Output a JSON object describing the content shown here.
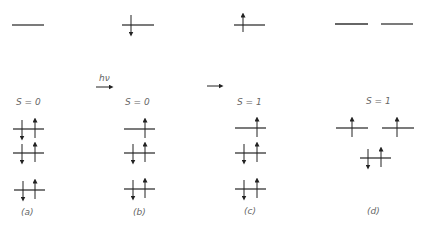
{
  "panels": [
    {
      "id": "a",
      "label": "(a)",
      "spin_label": "S = 0"
    },
    {
      "id": "b",
      "label": "(b)",
      "spin_label": "S = 0"
    },
    {
      "id": "c",
      "label": "(c)",
      "spin_label": "S = 1"
    },
    {
      "id": "d",
      "label": "(d)",
      "spin_label": "S = 1"
    }
  ],
  "arrows": {
    "photon_label": "hν"
  },
  "colors": {
    "line": "#333333",
    "text": "#666666"
  }
}
